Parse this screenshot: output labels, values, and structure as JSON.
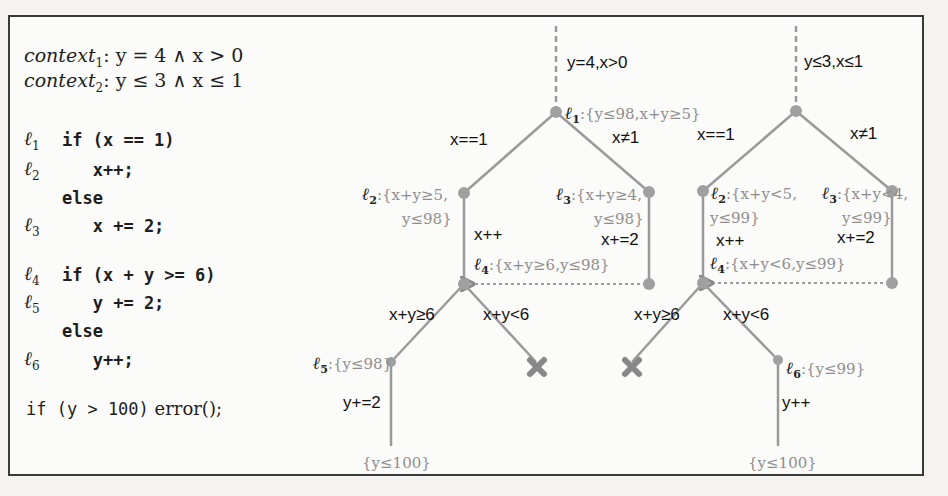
{
  "figure": {
    "contexts": [
      {
        "name": "context",
        "sub": "1",
        "formula": ": y = 4 ∧ x > 0"
      },
      {
        "name": "context",
        "sub": "2",
        "formula": ": y ≤ 3 ∧ x ≤ 1"
      }
    ],
    "code_lines": [
      {
        "label": "ℓ",
        "sub": "1",
        "code": "if (x == 1)"
      },
      {
        "label": "ℓ",
        "sub": "2",
        "code": "   x++;"
      },
      {
        "label": "",
        "sub": "",
        "code": "else"
      },
      {
        "label": "ℓ",
        "sub": "3",
        "code": "   x += 2;"
      },
      {
        "label": "ℓ",
        "sub": "4",
        "code": "if (x + y >= 6)"
      },
      {
        "label": "ℓ",
        "sub": "5",
        "code": "   y += 2;"
      },
      {
        "label": "",
        "sub": "",
        "code": "else"
      },
      {
        "label": "ℓ",
        "sub": "6",
        "code": "   y++;"
      }
    ],
    "final_line": {
      "prefix": "if (y > 100)",
      "suffix": "error();"
    },
    "tree1": {
      "entry_condition": "y=4,x>0",
      "root": {
        "loc": "ℓ",
        "sub": "1",
        "invariant": ":{y≤98,x+y≥5}"
      },
      "edge_left": "x==1",
      "edge_right": "x≠1",
      "l2": {
        "loc": "ℓ",
        "sub": "2",
        "invariant_line1": ":{x+y≥5,",
        "invariant_line2": "y≤98}"
      },
      "l3": {
        "loc": "ℓ",
        "sub": "3",
        "invariant_line1": ":{x+y≥4,",
        "invariant_line2": "y≤98}"
      },
      "edge_l2": "x++",
      "edge_l3": "x+=2",
      "l4": {
        "loc": "ℓ",
        "sub": "4",
        "invariant": ":{x+y≥6,y≤98}"
      },
      "edge_ge6": "x+y≥6",
      "edge_lt6": "x+y<6",
      "l5": {
        "loc": "ℓ",
        "sub": "5",
        "invariant": ":{y≤98}"
      },
      "edge_l5": "y+=2",
      "final": "{y≤100}"
    },
    "tree2": {
      "entry_condition": "y≤3,x≤1",
      "edge_left": "x==1",
      "edge_right": "x≠1",
      "l2": {
        "loc": "ℓ",
        "sub": "2",
        "invariant_line1": ":{x+y<5,",
        "invariant_line2": "y≤99}"
      },
      "l3": {
        "loc": "ℓ",
        "sub": "3",
        "invariant_line1": ":{x+y<4,",
        "invariant_line2": "y≤99}"
      },
      "edge_l2": "x++",
      "edge_l3": "x+=2",
      "l4": {
        "loc": "ℓ",
        "sub": "4",
        "invariant": ":{x+y<6,y≤99}"
      },
      "edge_ge6": "x+y≥6",
      "edge_lt6": "x+y<6",
      "l6": {
        "loc": "ℓ",
        "sub": "6",
        "invariant": ":{y≤99}"
      },
      "edge_l6": "y++",
      "final": "{y≤100}"
    },
    "colors": {
      "edge": "#9a9a9a",
      "node": "#a0a0a0",
      "invariant_text": "#8e8e8e",
      "infeasible_mark": "#8a8a8a"
    },
    "icons": {
      "infeasible": "cross-mark-icon"
    }
  }
}
